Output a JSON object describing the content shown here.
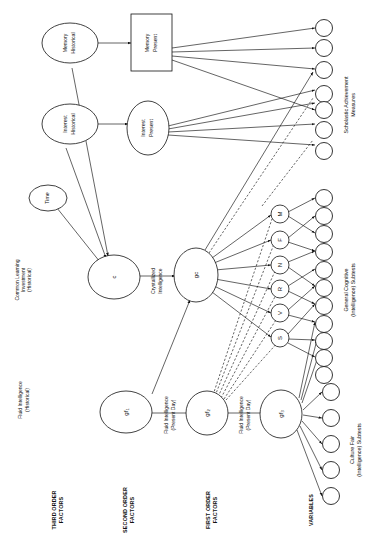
{
  "diagram": {
    "orientation": "rotated-90",
    "columns": [
      {
        "id": "third",
        "label": "THIRD ORDER\nFACTORS",
        "line1": "THIRD ORDER",
        "line2": "FACTORS"
      },
      {
        "id": "second",
        "label": "SECOND ORDER\nFACTORS",
        "line1": "SECOND ORDER",
        "line2": "FACTORS"
      },
      {
        "id": "first",
        "label": "FIRST ORDER\nFACTORS",
        "line1": "FIRST ORDER",
        "line2": "FACTORS"
      },
      {
        "id": "vars",
        "label": "VARIABLES",
        "line1": "VARIABLES",
        "line2": ""
      }
    ],
    "nodes": [
      {
        "id": "memory_hist",
        "line1": "Memory",
        "line2": "Historical",
        "shape": "ellipse"
      },
      {
        "id": "interest_hist",
        "line1": "Interest",
        "line2": "Historical",
        "shape": "ellipse"
      },
      {
        "id": "time",
        "line1": "Time",
        "line2": "",
        "shape": "ellipse"
      },
      {
        "id": "c",
        "line1": "c",
        "line2": "",
        "shape": "ellipse"
      },
      {
        "id": "gf1",
        "line1": "gf",
        "line2": "1",
        "shape": "ellipse"
      },
      {
        "id": "memory_present",
        "line1": "Memory",
        "line2": "Present",
        "shape": "rect"
      },
      {
        "id": "interest_present",
        "line1": "Interest",
        "line2": "Present",
        "shape": "ellipse"
      },
      {
        "id": "gc",
        "line1": "gc",
        "line2": "",
        "shape": "ellipse"
      },
      {
        "id": "gf2",
        "line1": "gf",
        "line2": "2",
        "shape": "ellipse"
      },
      {
        "id": "gf3",
        "line1": "gf",
        "line2": "3",
        "shape": "ellipse"
      },
      {
        "id": "factor_M",
        "line1": "M",
        "line2": "",
        "shape": "circle"
      },
      {
        "id": "factor_F",
        "line1": "F",
        "line2": "",
        "shape": "circle"
      },
      {
        "id": "factor_N",
        "line1": "N",
        "line2": "",
        "shape": "circle"
      },
      {
        "id": "factor_R",
        "line1": "R",
        "line2": "",
        "shape": "circle"
      },
      {
        "id": "factor_V",
        "line1": "V",
        "line2": "",
        "shape": "circle"
      },
      {
        "id": "factor_S",
        "line1": "S",
        "line2": "",
        "shape": "circle"
      }
    ],
    "edge_labels": [
      {
        "id": "common_learning",
        "line1": "Common Learning",
        "line2": "Investment",
        "line3": "(Historical)"
      },
      {
        "id": "fluid_hist",
        "line1": "Fluid Intelligence",
        "line2": "(Historical)",
        "line3": ""
      },
      {
        "id": "crystallized",
        "line1": "Crystallized",
        "line2": "Intelligence",
        "line3": ""
      },
      {
        "id": "fluid_present_1",
        "line1": "Fluid Intelligence",
        "line2": "(Present Day)",
        "line3": ""
      },
      {
        "id": "fluid_present_2",
        "line1": "Fluid Intelligence",
        "line2": "(Present Day)",
        "line3": ""
      }
    ],
    "variable_groups": [
      {
        "id": "scholastic",
        "line1": "Scholastic Achievement",
        "line2": "Measures",
        "count": 7
      },
      {
        "id": "general_cog",
        "line1": "General Cognitive",
        "line2": "(Intelligence) Subtests",
        "count": 11
      },
      {
        "id": "culture_fair",
        "line1": "Culture Fair",
        "line2": "(Intelligence) Subtests",
        "count": 5
      }
    ],
    "colors": {
      "stroke": "#111111",
      "fill": "#ffffff",
      "background": "#ffffff"
    }
  }
}
